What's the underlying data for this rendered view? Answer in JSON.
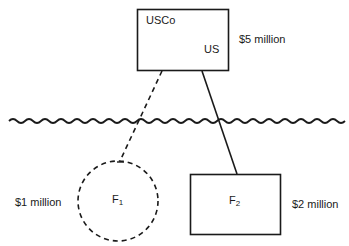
{
  "diagram": {
    "parent": {
      "name": "USCo",
      "jurisdiction": "US",
      "value": "$5 million",
      "shape": "rectangle",
      "border": "solid"
    },
    "border_line": {
      "type": "wavy",
      "meaning": "national border"
    },
    "subsidiaries": [
      {
        "name": "F",
        "subscript": "1",
        "value": "$1 million",
        "shape": "circle",
        "border": "dashed",
        "connector": "dashed"
      },
      {
        "name": "F",
        "subscript": "2",
        "value": "$2 million",
        "shape": "rectangle",
        "border": "solid",
        "connector": "solid"
      }
    ],
    "colors": {
      "stroke": "#1a1a1a",
      "background": "#ffffff"
    }
  }
}
